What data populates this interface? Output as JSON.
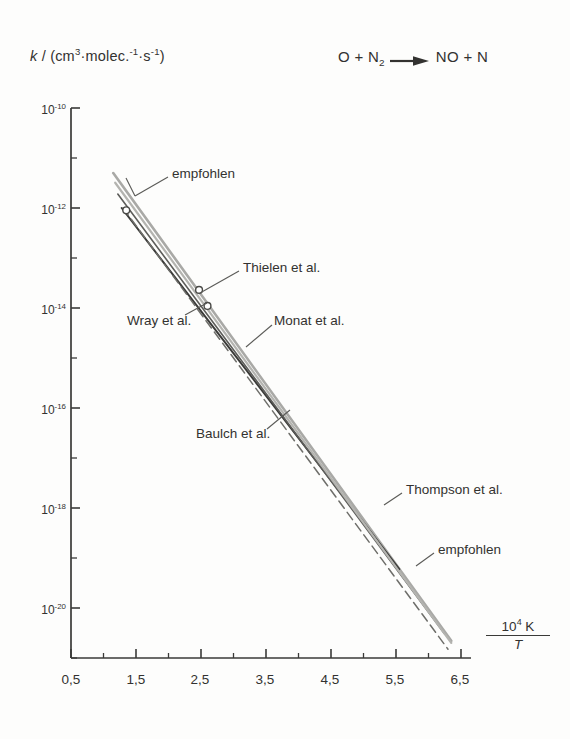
{
  "figure": {
    "y_axis_label_html": "k / (cm3·molec.-1·s-1)",
    "reaction": "O + N2 -> NO + N",
    "reaction_parts": {
      "left_species_1": "O",
      "plus_1": "+",
      "left_species_2": "N",
      "left_species_2_sub": "2",
      "arrow": "arrow-right",
      "right_species_1": "NO",
      "plus_2": "+",
      "right_species_2": "N"
    },
    "x_unit": {
      "numerator_base": "10",
      "numerator_exp": "4",
      "numerator_unit": "K",
      "denominator": "T"
    }
  },
  "chart_data": {
    "type": "line",
    "title": "",
    "subtitle": "",
    "xlabel": "10^4 K / T",
    "ylabel": "k / (cm^3 molec^-1 s^-1)",
    "xlim": [
      0.5,
      6.5
    ],
    "ylim": [
      1e-21,
      1e-10
    ],
    "yscale": "log",
    "grid": false,
    "legend": "inline-annotations",
    "xticks": [
      "0,5",
      "1,5",
      "2,5",
      "3,5",
      "4,5",
      "5,5",
      "6,5"
    ],
    "xtick_values": [
      0.5,
      1.5,
      2.5,
      3.5,
      4.5,
      5.5,
      6.5
    ],
    "xminor_step": 0.5,
    "yticks": [
      "10-10",
      "10-12",
      "10-14",
      "10-16",
      "10-18",
      "10-20"
    ],
    "ytick_exponents": [
      -10,
      -12,
      -14,
      -16,
      -18,
      -20
    ],
    "yminor_exponents": [
      -11,
      -13,
      -15,
      -17,
      -19,
      -21
    ],
    "series": [
      {
        "name": "empfohlen (upper)",
        "label": "empfohlen",
        "color": "#a9a9a6",
        "style": "solid",
        "width": 2.6,
        "points": [
          [
            1.15,
            5e-12
          ],
          [
            6.35,
            2.2e-21
          ]
        ]
      },
      {
        "name": "Thompson et al.",
        "label": "Thompson et al.",
        "color": "#3b3b39",
        "style": "solid",
        "width": 2.0,
        "points": [
          [
            1.28,
            1e-12
          ],
          [
            5.55,
            6e-20
          ]
        ]
      },
      {
        "name": "Monat et al.",
        "label": "Monat et al.",
        "color": "#5d5d5a",
        "style": "solid",
        "width": 1.6,
        "points": [
          [
            1.22,
            1.9e-12
          ],
          [
            6.25,
            3e-21
          ]
        ]
      },
      {
        "name": "Baulch et al.",
        "label": "Baulch et al.",
        "color": "#6e6e6a",
        "style": "dashed",
        "width": 1.5,
        "points": [
          [
            1.3,
            1e-12
          ],
          [
            6.3,
            1.5e-21
          ]
        ]
      },
      {
        "name": "empfohlen (lower)",
        "label": "empfohlen",
        "color": "#b4b4b0",
        "style": "solid",
        "width": 2.2,
        "points": [
          [
            1.18,
            3.2e-12
          ],
          [
            6.35,
            2e-21
          ]
        ]
      }
    ],
    "markers": [
      {
        "name": "Wray et al.",
        "x": 1.35,
        "y": 9e-13
      },
      {
        "name": "Thielen et al.",
        "x": 2.47,
        "y": 2.3e-14
      },
      {
        "name": "Wray et al. point",
        "x": 2.6,
        "y": 1.1e-14
      }
    ],
    "annotations": [
      {
        "text": "empfohlen",
        "x_px": 172,
        "y_px": 174
      },
      {
        "text": "Thielen et al.",
        "x_px": 243,
        "y_px": 268
      },
      {
        "text": "Wray et al.",
        "x_px": 127,
        "y_px": 320
      },
      {
        "text": "Monat et al.",
        "x_px": 274,
        "y_px": 321
      },
      {
        "text": "Baulch et al.",
        "x_px": 196,
        "y_px": 434
      },
      {
        "text": "Thompson et al.",
        "x_px": 406,
        "y_px": 489
      },
      {
        "text": "empfohlen",
        "x_px": 438,
        "y_px": 550
      }
    ]
  },
  "labels": {
    "empfohlen_top": "empfohlen",
    "thielen": "Thielen et al.",
    "wray": "Wray et al.",
    "monat": "Monat et al.",
    "baulch": "Baulch et al.",
    "thompson": "Thompson et al.",
    "empfohlen_bottom": "empfohlen",
    "ytick_10_10": "10",
    "ytick_exp_10": "-10",
    "ytick_exp_12": "-12",
    "ytick_exp_14": "-14",
    "ytick_exp_16": "-16",
    "ytick_exp_18": "-18",
    "ytick_exp_20": "-20",
    "xtick_05": "0,5",
    "xtick_15": "1,5",
    "xtick_25": "2,5",
    "xtick_35": "3,5",
    "xtick_45": "4,5",
    "xtick_55": "5,5",
    "xtick_65": "6,5"
  }
}
